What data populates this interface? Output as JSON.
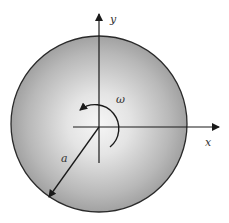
{
  "diagram": {
    "type": "rotating disk",
    "labels": {
      "x_axis": "x",
      "y_axis": "y",
      "angular_velocity": "ω",
      "radius": "a"
    },
    "colors": {
      "disk_center": "#f4f4f4",
      "disk_edge": "#9a9a9a",
      "outline": "#2a2a2a",
      "lines": "#1a1a1a"
    }
  }
}
